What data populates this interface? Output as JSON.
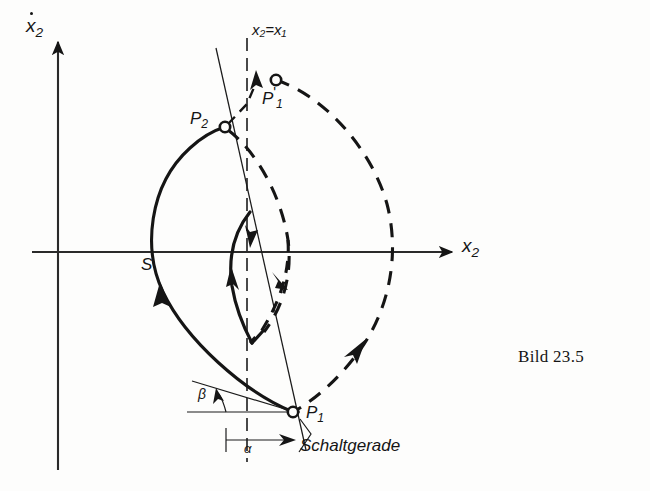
{
  "figure": {
    "caption": "Bild 23.5",
    "axes": {
      "y_label_base": "x",
      "y_label_sub": "2",
      "x_label_base": "x",
      "x_label_sub": "2",
      "origin_x": 58,
      "origin_y": 252
    },
    "labels": {
      "p2": "P",
      "p2_sub": "2",
      "p1_prime": "P",
      "p1_prime_sub": "1",
      "p1_prime_mark": "'",
      "p1": "P",
      "p1_sub": "1",
      "saddle": "S",
      "switch_equation": "x₂=x₁",
      "alpha": "α",
      "beta": "β",
      "switch_line": "Schaltgerade"
    },
    "colors": {
      "ink": "#151515",
      "paper": "#fdfdfc",
      "axis": "#2a2a2a"
    },
    "points": {
      "P2": {
        "x": 225,
        "y": 127
      },
      "P1prime": {
        "x": 276,
        "y": 80
      },
      "P1": {
        "x": 293,
        "y": 412
      },
      "S": {
        "x": 156,
        "y": 252
      }
    },
    "line_styles": {
      "solid_trajectory": "solid",
      "dashed_trajectory": "dashed",
      "switch_line": "thin-solid",
      "equal_line": "dash-dot"
    }
  }
}
